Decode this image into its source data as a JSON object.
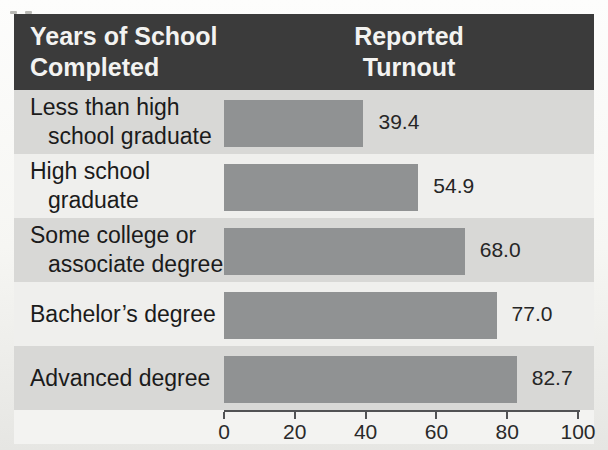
{
  "header": {
    "column1": "Years of School Completed",
    "column2": "Reported Turnout"
  },
  "chart_data": {
    "type": "bar",
    "orientation": "horizontal",
    "title": "",
    "column_headers": [
      "Years of School Completed",
      "Reported Turnout"
    ],
    "categories": [
      "Less than high school graduate",
      "High school graduate",
      "Some college or associate degree",
      "Bachelor’s degree",
      "Advanced degree"
    ],
    "values": [
      39.4,
      54.9,
      68.0,
      77.0,
      82.7
    ],
    "value_labels": [
      "39.4",
      "54.9",
      "68.0",
      "77.0",
      "82.7"
    ],
    "xlabel": "",
    "ylabel": "",
    "xlim": [
      0,
      100
    ],
    "x_ticks": [
      0,
      20,
      40,
      60,
      80,
      100
    ],
    "grid": false,
    "legend": "none",
    "bar_color": "#909293",
    "header_bg": "#3b3b3b",
    "band_colors": [
      "#d8d8d6",
      "#efefed"
    ],
    "axis_color": "#515254"
  }
}
